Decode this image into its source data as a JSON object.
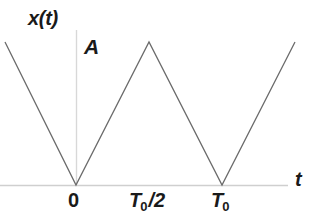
{
  "figure": {
    "background_color": "#ffffff",
    "width": 317,
    "height": 223
  },
  "labels": {
    "y_axis_signal": "x(t)",
    "amplitude": "A",
    "x_axis": "t",
    "origin": "0",
    "half_period": "T",
    "half_period_sub": "0",
    "half_period_suffix": "/2",
    "period": "T",
    "period_sub": "0"
  },
  "axes": {
    "x_axis_color": "#cfcfcf",
    "y_axis_color": "#d8d8d8",
    "x_axis_y_px": 185,
    "y_axis_x_px": 76,
    "x_axis_start_px": 0,
    "x_axis_end_px": 288,
    "y_axis_top_px": 30,
    "grid": false
  },
  "chart_data": {
    "type": "line",
    "title": "",
    "subtitle": "",
    "xlabel": "t",
    "ylabel": "x(t)",
    "waveform": "triangular",
    "amplitude": "A",
    "period": "T_0",
    "legend": "none",
    "line_color": "#6b6b6b",
    "line_width_px": 1.3,
    "xlim": [
      "-T_0/2 (approx)",
      "1.5*T_0 (approx)"
    ],
    "ylim": [
      0,
      "A"
    ],
    "x_tick_labels": [
      "0",
      "T0/2",
      "T0"
    ],
    "x_tick_values": [
      0,
      0.5,
      1.0
    ],
    "x": [
      -0.486,
      0.0,
      0.5,
      1.0,
      1.5
    ],
    "y": [
      1.0,
      0.0,
      1.0,
      0.0,
      1.0
    ],
    "annotations": [
      {
        "text": "A",
        "x": 0.06,
        "y": 1.0,
        "role": "amplitude-marker"
      },
      {
        "text": "x(t)",
        "x": -0.33,
        "y": 1.18,
        "role": "y-axis-name"
      },
      {
        "text": "t",
        "x": 1.5,
        "y": 0.09,
        "role": "x-axis-name"
      }
    ],
    "pixel_vertices": [
      {
        "x": 5,
        "y": 42
      },
      {
        "x": 76,
        "y": 185
      },
      {
        "x": 149,
        "y": 42
      },
      {
        "x": 222,
        "y": 185
      },
      {
        "x": 295,
        "y": 42
      }
    ]
  }
}
